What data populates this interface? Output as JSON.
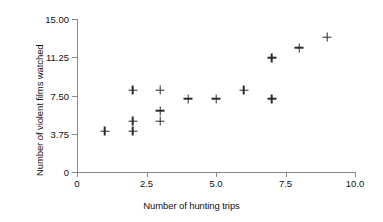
{
  "chart_data": {
    "type": "scatter",
    "title": "",
    "xlabel": "Number of hunting trips",
    "ylabel": "Number of violent films watched",
    "xlim": [
      0,
      10.0
    ],
    "ylim": [
      0,
      15.0
    ],
    "grid": false,
    "legend": null,
    "marker": "plus",
    "marker_color": "#2b2b2b",
    "axis_color": "#8a8a8a",
    "xticks": [
      {
        "value": 0,
        "label": "0"
      },
      {
        "value": 2.5,
        "label": "2.5"
      },
      {
        "value": 5.0,
        "label": "5.0"
      },
      {
        "value": 7.5,
        "label": "7.5"
      },
      {
        "value": 10.0,
        "label": "10.0"
      }
    ],
    "yticks": [
      {
        "value": 0,
        "label": "0"
      },
      {
        "value": 3.75,
        "label": "3.75"
      },
      {
        "value": 7.5,
        "label": "7.50"
      },
      {
        "value": 11.25,
        "label": "11.25"
      },
      {
        "value": 15.0,
        "label": "15.00"
      }
    ],
    "points": [
      {
        "x": 1,
        "y": 4.0
      },
      {
        "x": 2,
        "y": 8.0
      },
      {
        "x": 2,
        "y": 5.0
      },
      {
        "x": 2,
        "y": 4.0
      },
      {
        "x": 3,
        "y": 8.0
      },
      {
        "x": 3,
        "y": 6.0
      },
      {
        "x": 3,
        "y": 5.0
      },
      {
        "x": 4,
        "y": 7.2
      },
      {
        "x": 5,
        "y": 7.2
      },
      {
        "x": 6,
        "y": 8.0
      },
      {
        "x": 7,
        "y": 11.2
      },
      {
        "x": 7,
        "y": 7.2
      },
      {
        "x": 8,
        "y": 12.2
      },
      {
        "x": 9,
        "y": 13.2
      }
    ],
    "n_points": 14
  }
}
